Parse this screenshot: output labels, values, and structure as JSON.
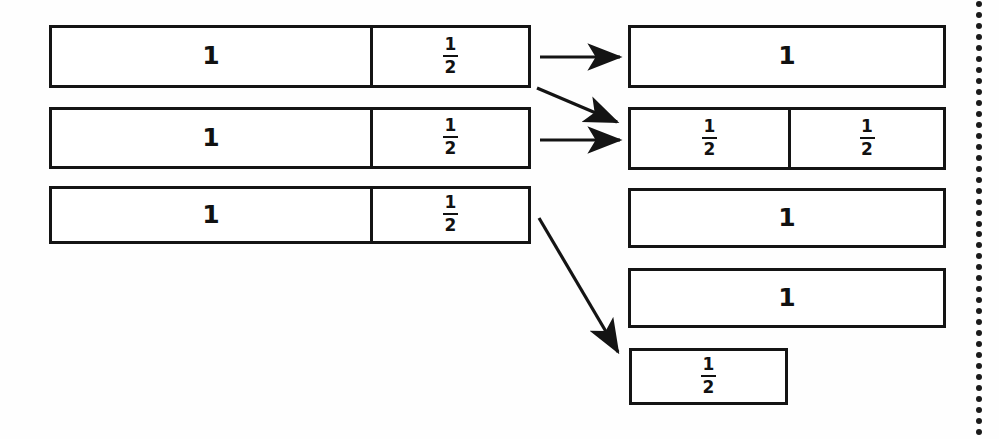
{
  "diagram": {
    "ink_color": "#141414",
    "paper_color": "#ffffff",
    "left_column": {
      "label": "before-regrouping",
      "bars": [
        {
          "name": "left-bar-1",
          "cells": [
            {
              "kind": "whole",
              "value": "1"
            },
            {
              "kind": "fraction",
              "numerator": "1",
              "denominator": "2",
              "value": "1/2"
            }
          ]
        },
        {
          "name": "left-bar-2",
          "cells": [
            {
              "kind": "whole",
              "value": "1"
            },
            {
              "kind": "fraction",
              "numerator": "1",
              "denominator": "2",
              "value": "1/2"
            }
          ]
        },
        {
          "name": "left-bar-3",
          "cells": [
            {
              "kind": "whole",
              "value": "1"
            },
            {
              "kind": "fraction",
              "numerator": "1",
              "denominator": "2",
              "value": "1/2"
            }
          ]
        }
      ]
    },
    "right_column": {
      "label": "after-regrouping",
      "bars": [
        {
          "name": "right-bar-1",
          "cells": [
            {
              "kind": "whole",
              "value": "1"
            }
          ]
        },
        {
          "name": "right-bar-2",
          "cells": [
            {
              "kind": "fraction",
              "numerator": "1",
              "denominator": "2",
              "value": "1/2"
            },
            {
              "kind": "fraction",
              "numerator": "1",
              "denominator": "2",
              "value": "1/2"
            }
          ]
        },
        {
          "name": "right-bar-3",
          "cells": [
            {
              "kind": "whole",
              "value": "1"
            }
          ]
        },
        {
          "name": "right-bar-4",
          "cells": [
            {
              "kind": "whole",
              "value": "1"
            }
          ]
        },
        {
          "name": "right-bar-5",
          "cells": [
            {
              "kind": "fraction",
              "numerator": "1",
              "denominator": "2",
              "value": "1/2"
            }
          ]
        }
      ]
    },
    "arrows": [
      {
        "name": "arrow-row1-to-whole",
        "from": "left-bar-1",
        "to": "right-bar-1",
        "style": "straight"
      },
      {
        "name": "arrow-row1-to-halves",
        "from": "left-bar-1",
        "to": "right-bar-2",
        "style": "diagonal"
      },
      {
        "name": "arrow-row2-to-halves",
        "from": "left-bar-2",
        "to": "right-bar-2",
        "style": "straight"
      },
      {
        "name": "arrow-row3-to-half",
        "from": "left-bar-3",
        "to": "right-bar-5",
        "style": "diagonal"
      }
    ],
    "dotted_rule": {
      "name": "page-edge-dotted-rule",
      "dot_count": 40,
      "dot_color": "#1a1a1a"
    }
  }
}
